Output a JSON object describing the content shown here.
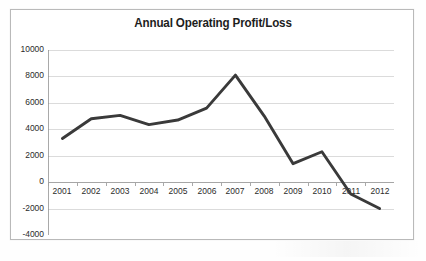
{
  "chart_data": {
    "type": "line",
    "title": "Annual Operating Profit/Loss",
    "xlabel": "",
    "ylabel": "",
    "categories": [
      "2001",
      "2002",
      "2003",
      "2004",
      "2005",
      "2006",
      "2007",
      "2008",
      "2009",
      "2010",
      "2011",
      "2012"
    ],
    "values": [
      3300,
      4800,
      5050,
      4350,
      4700,
      5600,
      8100,
      5000,
      1400,
      2300,
      -900,
      -2000
    ],
    "series": [
      {
        "name": "Annual Operating Profit/Loss",
        "values": [
          3300,
          4800,
          5050,
          4350,
          4700,
          5600,
          8100,
          5000,
          1400,
          2300,
          -900,
          -2000
        ],
        "color": "#3a3a3a"
      }
    ],
    "ylim": [
      -4000,
      10000
    ],
    "ytick_step": 2000,
    "ytick_labels": [
      "10000",
      "8000",
      "6000",
      "4000",
      "2000",
      "0",
      "-2000",
      "-4000"
    ],
    "ytick_values": [
      10000,
      8000,
      6000,
      4000,
      2000,
      0,
      -2000,
      -4000
    ],
    "grid": true,
    "grid_axis": "y",
    "legend": false,
    "legend_position": "none",
    "markers": false,
    "axis_crosses_at": 0,
    "colors": {
      "series": "#3a3a3a",
      "gridline": "#d2d2d2",
      "axis": "#a0a0a0",
      "text": "#2b2b2b",
      "border": "#b9b9b9",
      "plot_background": "#ffffff"
    }
  }
}
